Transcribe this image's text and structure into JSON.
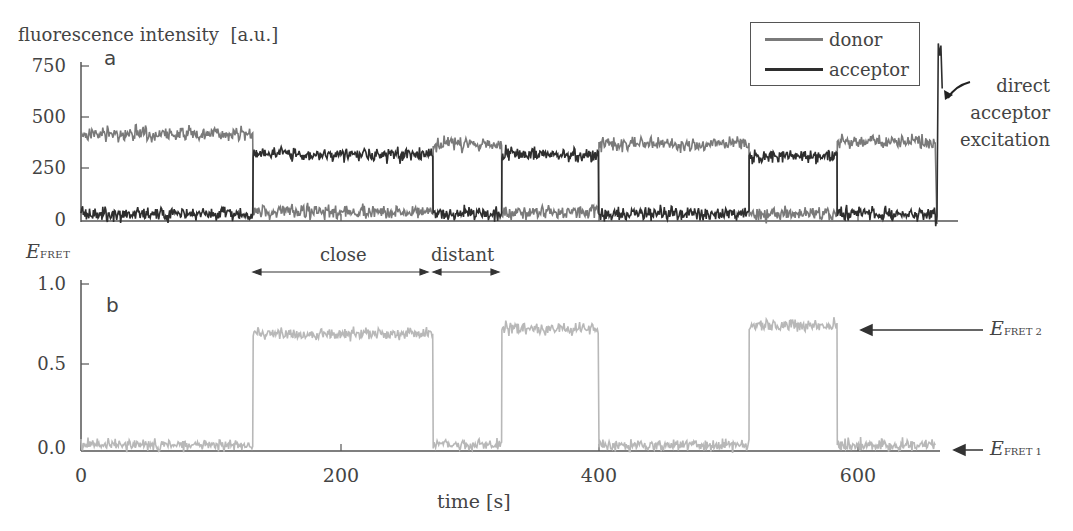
{
  "colors": {
    "donor": "#7a7a7a",
    "acceptor": "#2e2e2e",
    "fret": "#b8b8b8",
    "axis": "#555555"
  },
  "panel_a": {
    "label": "a",
    "ylabel": "fluorescence intensity",
    "yunit": "[a.u.]",
    "yticks": [
      "0",
      "250",
      "500",
      "750"
    ],
    "annotation": [
      "direct",
      "acceptor",
      "excitation"
    ],
    "legend": [
      {
        "name": "donor"
      },
      {
        "name": "acceptor"
      }
    ]
  },
  "panel_b": {
    "label": "b",
    "ylabel": "E",
    "ylabel_sub": "FRET",
    "yticks": [
      "0.0",
      "0.5",
      "1.0"
    ],
    "close_label": "close",
    "distant_label": "distant",
    "level2_label": "E",
    "level2_sub": "FRET 2",
    "level1_label": "E",
    "level1_sub": "FRET 1"
  },
  "xaxis": {
    "ticks": [
      "0",
      "200",
      "400",
      "600"
    ],
    "label": "time",
    "unit": "[s]"
  },
  "chart_data": [
    {
      "type": "line",
      "title": "a",
      "xlabel": "time [s]",
      "ylabel": "fluorescence intensity [a.u.]",
      "xlim": [
        0,
        670
      ],
      "ylim": [
        0,
        800
      ],
      "yticks": [
        0,
        250,
        500,
        750
      ],
      "legend_position": "upper right",
      "series": [
        {
          "name": "donor",
          "segments": [
            {
              "t_start": 0,
              "t_end": 133,
              "level": 420
            },
            {
              "t_start": 133,
              "t_end": 272,
              "level": 40
            },
            {
              "t_start": 272,
              "t_end": 325,
              "level": 370
            },
            {
              "t_start": 325,
              "t_end": 400,
              "level": 40
            },
            {
              "t_start": 400,
              "t_end": 516,
              "level": 370
            },
            {
              "t_start": 516,
              "t_end": 584,
              "level": 30
            },
            {
              "t_start": 584,
              "t_end": 660,
              "level": 380
            },
            {
              "t_start": 660,
              "t_end": 665,
              "level": 0
            }
          ]
        },
        {
          "name": "acceptor",
          "segments": [
            {
              "t_start": 0,
              "t_end": 133,
              "level": 30
            },
            {
              "t_start": 133,
              "t_end": 272,
              "level": 320
            },
            {
              "t_start": 272,
              "t_end": 325,
              "level": 30
            },
            {
              "t_start": 325,
              "t_end": 400,
              "level": 320
            },
            {
              "t_start": 400,
              "t_end": 516,
              "level": 30
            },
            {
              "t_start": 516,
              "t_end": 584,
              "level": 310
            },
            {
              "t_start": 584,
              "t_end": 660,
              "level": 30
            },
            {
              "t_start": 662,
              "t_end": 668,
              "level": 840
            }
          ]
        }
      ],
      "annotations": [
        "direct acceptor excitation (spike ~850 at t≈662 s)"
      ]
    },
    {
      "type": "line",
      "title": "b",
      "xlabel": "time [s]",
      "ylabel": "E_FRET",
      "xlim": [
        0,
        670
      ],
      "ylim": [
        0,
        1.05
      ],
      "xticks": [
        0,
        200,
        400,
        600
      ],
      "yticks": [
        0.0,
        0.5,
        1.0
      ],
      "series": [
        {
          "name": "E_FRET",
          "segments": [
            {
              "t_start": 0,
              "t_end": 133,
              "level": 0.03
            },
            {
              "t_start": 133,
              "t_end": 272,
              "level": 0.7
            },
            {
              "t_start": 272,
              "t_end": 325,
              "level": 0.03
            },
            {
              "t_start": 325,
              "t_end": 400,
              "level": 0.73
            },
            {
              "t_start": 400,
              "t_end": 516,
              "level": 0.03
            },
            {
              "t_start": 516,
              "t_end": 584,
              "level": 0.75
            },
            {
              "t_start": 584,
              "t_end": 660,
              "level": 0.03
            }
          ]
        }
      ],
      "annotations": [
        "close: 133–272 s",
        "distant: 272–325 s",
        "E_FRET2 ≈ 0.72",
        "E_FRET1 ≈ 0.0"
      ]
    }
  ]
}
